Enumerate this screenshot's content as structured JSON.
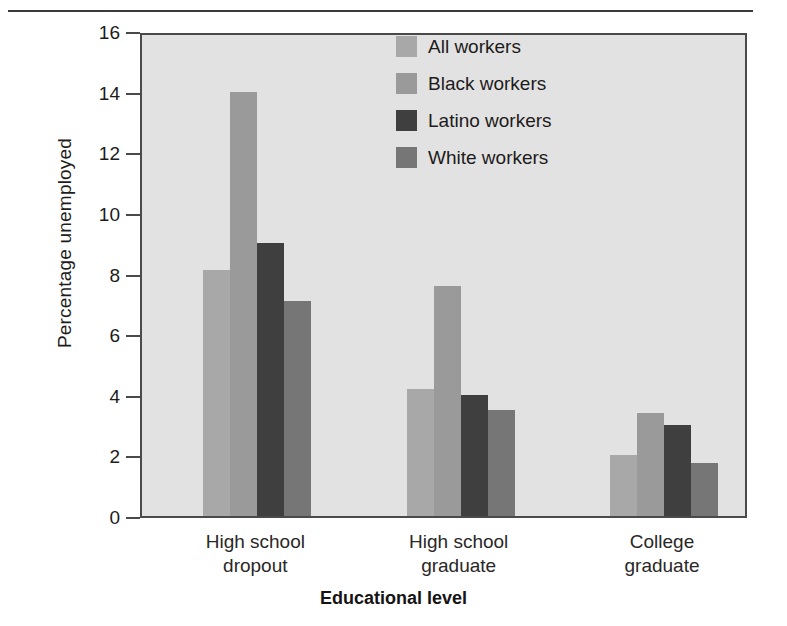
{
  "chart_data": {
    "type": "bar",
    "title": "",
    "subtitle": "",
    "xlabel": "Educational level",
    "ylabel": "Percentage unemployed",
    "categories": [
      "High school dropout",
      "High school graduate",
      "College graduate"
    ],
    "category_lines": [
      [
        "High school",
        "dropout"
      ],
      [
        "High school",
        "graduate"
      ],
      [
        "College",
        "graduate"
      ]
    ],
    "series": [
      {
        "name": "All workers",
        "color": "#a8a8a8",
        "values": [
          8.1,
          4.2,
          2.0
        ]
      },
      {
        "name": "Black workers",
        "color": "#9a9a9a",
        "values": [
          14.0,
          7.6,
          3.4
        ]
      },
      {
        "name": "Latino workers",
        "color": "#3f3f3f",
        "values": [
          9.0,
          4.0,
          3.0
        ]
      },
      {
        "name": "White workers",
        "color": "#767676",
        "values": [
          7.1,
          3.5,
          1.75
        ]
      }
    ],
    "ylim": [
      0,
      16
    ],
    "yticks": [
      0,
      2,
      4,
      6,
      8,
      10,
      12,
      14,
      16
    ],
    "ytick_labels": [
      "0",
      "2",
      "4",
      "6",
      "8",
      "10",
      "12",
      "14",
      "16"
    ],
    "grid": false,
    "legend_position": "upper right",
    "plot_background": "#e2e2e2",
    "axis_color": "#4a4a4a",
    "figure_background": "#ffffff"
  },
  "legend": {
    "items": [
      {
        "label": "All workers"
      },
      {
        "label": "Black workers"
      },
      {
        "label": "Latino workers"
      },
      {
        "label": "White workers"
      }
    ]
  }
}
